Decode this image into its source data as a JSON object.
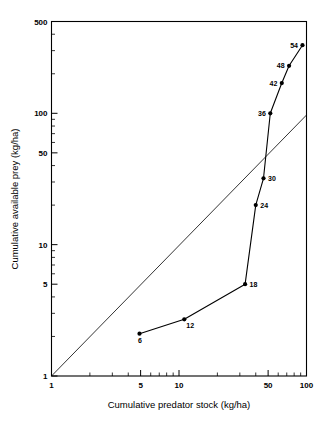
{
  "chart_data": {
    "type": "line",
    "title": "",
    "subtitle": "",
    "xlabel": "Cumulative predator stock (kg/ha)",
    "ylabel": "Cumulative available prey (kg/ha)",
    "xscale": "log",
    "yscale": "log",
    "xlim": [
      1,
      100
    ],
    "ylim": [
      1,
      500
    ],
    "grid": false,
    "legend": null,
    "xticks": [
      1,
      5,
      10,
      50,
      100
    ],
    "xtick_labels": [
      "1",
      "5",
      "10",
      "50",
      "100"
    ],
    "yticks": [
      1,
      5,
      10,
      50,
      100,
      500
    ],
    "ytick_labels": [
      "1",
      "5",
      "10",
      "50",
      "100",
      "500"
    ],
    "x_minor_ticks": [
      2,
      3,
      4,
      6,
      7,
      8,
      9,
      20,
      30,
      40,
      60,
      70,
      80,
      90
    ],
    "y_minor_ticks": [
      2,
      3,
      4,
      6,
      7,
      8,
      9,
      20,
      30,
      40,
      60,
      70,
      80,
      90,
      200,
      300,
      400
    ],
    "series": [
      {
        "name": "cumulative-series",
        "marker": "filled-circle",
        "points": [
          {
            "label": "6",
            "x": 4.9,
            "y": 2.1,
            "label_pos": "below"
          },
          {
            "label": "12",
            "x": 11.0,
            "y": 2.7,
            "label_pos": "below-right"
          },
          {
            "label": "18",
            "x": 33.0,
            "y": 5.0,
            "label_pos": "right"
          },
          {
            "label": "24",
            "x": 40.0,
            "y": 20.0,
            "label_pos": "right"
          },
          {
            "label": "30",
            "x": 46.0,
            "y": 32.0,
            "label_pos": "right"
          },
          {
            "label": "36",
            "x": 52.0,
            "y": 100.0,
            "label_pos": "left"
          },
          {
            "label": "42",
            "x": 64.0,
            "y": 170.0,
            "label_pos": "left"
          },
          {
            "label": "48",
            "x": 73.0,
            "y": 230.0,
            "label_pos": "left"
          },
          {
            "label": "54",
            "x": 93.0,
            "y": 330.0,
            "label_pos": "left"
          }
        ]
      },
      {
        "name": "reference-line-1-to-1",
        "marker": "none",
        "annotation": "diagonal reference line",
        "points": [
          {
            "label": "",
            "x": 1.0,
            "y": 1.0
          },
          {
            "label": "",
            "x": 100.0,
            "y": 97.0
          }
        ]
      }
    ],
    "colors": {
      "line": "#000000",
      "marker": "#000000",
      "axis": "#000000",
      "background": "#ffffff"
    }
  }
}
